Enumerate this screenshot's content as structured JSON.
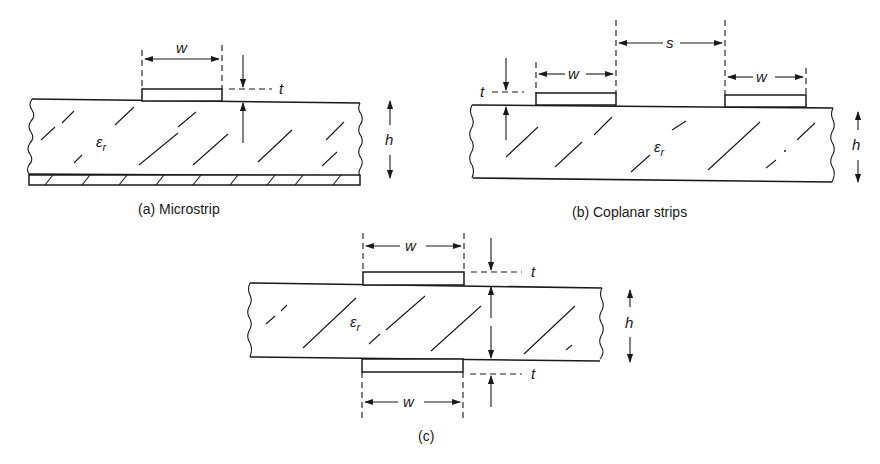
{
  "figure": {
    "panels": [
      {
        "id": "a",
        "caption": "(a)  Microstrip",
        "labels": {
          "width": "w",
          "thickness": "t",
          "height": "h",
          "permittivity": "ε",
          "permittivity_sub": "r"
        }
      },
      {
        "id": "b",
        "caption": "(b)  Coplanar strips",
        "labels": {
          "width_left": "w",
          "width_right": "w",
          "spacing": "s",
          "thickness": "t",
          "height": "h",
          "permittivity": "ε",
          "permittivity_sub": "r"
        }
      },
      {
        "id": "c",
        "caption": "(c)",
        "labels": {
          "width_top": "w",
          "width_bottom": "w",
          "thickness_top": "t",
          "thickness_bottom": "t",
          "height": "h",
          "permittivity": "ε",
          "permittivity_sub": "r"
        }
      }
    ]
  },
  "colors": {
    "ink": "#1a1a1a",
    "background": "#ffffff"
  }
}
